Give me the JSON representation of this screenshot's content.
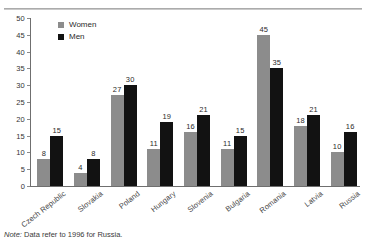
{
  "chart_data": {
    "type": "bar",
    "title": "",
    "xlabel": "",
    "ylabel": "",
    "ylim": [
      0,
      50
    ],
    "yticks": [
      0,
      5,
      10,
      15,
      20,
      25,
      30,
      35,
      40,
      45,
      50
    ],
    "grid": false,
    "legend_position": "top-left",
    "categories": [
      "Czech Republic",
      "Slovakia",
      "Poland",
      "Hungary",
      "Slovenia",
      "Bulgaria",
      "Romania",
      "Latvia",
      "Russia"
    ],
    "series": [
      {
        "name": "Women",
        "color": "#8c8c8c",
        "values": [
          8,
          4,
          27,
          11,
          16,
          11,
          45,
          18,
          10
        ]
      },
      {
        "name": "Men",
        "color": "#121212",
        "values": [
          15,
          8,
          30,
          19,
          21,
          15,
          35,
          21,
          16
        ]
      }
    ],
    "annotations": {
      "note_lead": "Note:",
      "note_text": " Data refer to 1996 for Russia."
    }
  }
}
